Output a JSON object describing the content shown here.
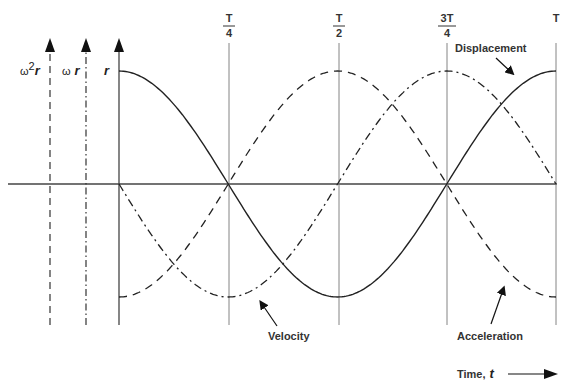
{
  "diagram": {
    "axes": [
      {
        "label_base": "ω",
        "label_sup": "2",
        "label_var": "r",
        "style": "dashed"
      },
      {
        "label_base": "ω",
        "label_var": "r",
        "style": "dash-dot"
      },
      {
        "label_var": "r",
        "style": "solid"
      }
    ],
    "ticks": [
      {
        "num": "T",
        "den": "4"
      },
      {
        "num": "T",
        "den": "2"
      },
      {
        "num": "3T",
        "den": "4"
      },
      {
        "num": "T"
      }
    ],
    "curves": {
      "displacement": "Displacement",
      "velocity": "Velocity",
      "acceleration": "Acceleration"
    },
    "time_axis": {
      "label": "Time,",
      "var": "t"
    }
  },
  "chart_data": {
    "type": "line",
    "title": "",
    "xlabel": "Time, t",
    "x": [
      0,
      0.125,
      0.25,
      0.375,
      0.5,
      0.625,
      0.75,
      0.875,
      1.0
    ],
    "x_ticks": [
      "0",
      "T/4",
      "T/2",
      "3T/4",
      "T"
    ],
    "series": [
      {
        "name": "Displacement",
        "style": "solid",
        "values": [
          1,
          0.707,
          0,
          -0.707,
          -1,
          -0.707,
          0,
          0.707,
          1
        ]
      },
      {
        "name": "Velocity",
        "style": "dash-dot",
        "values": [
          0,
          -0.707,
          -1,
          -0.707,
          0,
          0.707,
          1,
          0.707,
          0
        ]
      },
      {
        "name": "Acceleration",
        "style": "dashed",
        "values": [
          -1,
          -0.707,
          0,
          0.707,
          1,
          0.707,
          0,
          -0.707,
          -1
        ]
      }
    ],
    "ylim": [
      -1,
      1
    ],
    "grid": false
  }
}
